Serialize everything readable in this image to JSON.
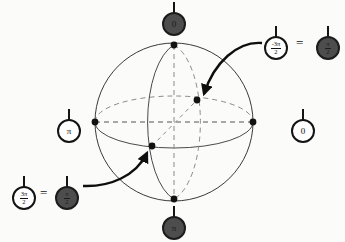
{
  "figure": {
    "type": "diagram",
    "background_color": "#fbfbfa",
    "line_color": "#3a3a3a",
    "dash_color": "#7a7a7a",
    "marker_fill_dark": "#4d4d4d",
    "marker_fill_light": "#ffffff",
    "marker_stroke": "#141414"
  },
  "sphere": {
    "center": {
      "x": 174,
      "y": 122
    },
    "radius": 79,
    "equator_ry": 26,
    "meridian_rx": 34,
    "points": [
      {
        "name": "north-pole",
        "x": 174,
        "y": 45
      },
      {
        "name": "south-pole",
        "x": 174,
        "y": 199
      },
      {
        "name": "equator-left",
        "x": 95,
        "y": 122
      },
      {
        "name": "equator-right",
        "x": 253,
        "y": 122
      },
      {
        "name": "equator-back",
        "x": 197,
        "y": 100
      },
      {
        "name": "equator-front",
        "x": 152,
        "y": 146
      }
    ]
  },
  "markers": {
    "top": {
      "label": "0",
      "kind": "plain",
      "filled": true,
      "x": 162,
      "y": 2
    },
    "bottom": {
      "label": "π",
      "kind": "plain",
      "filled": true,
      "x": 162,
      "y": 206
    },
    "left": {
      "label": "π",
      "kind": "plain",
      "filled": false,
      "x": 57,
      "y": 109
    },
    "right": {
      "label": "0",
      "kind": "plain",
      "filled": false,
      "x": 291,
      "y": 109
    },
    "upper_pair": {
      "left": {
        "numerator": "-3π",
        "denominator": "2",
        "kind": "fraction",
        "filled": false,
        "x": 264,
        "y": 26
      },
      "equals": "=",
      "right": {
        "numerator": "π",
        "denominator": "2",
        "kind": "fraction",
        "filled": true,
        "x": 316,
        "y": 26
      }
    },
    "lower_pair": {
      "left": {
        "numerator": "3π",
        "denominator": "2",
        "kind": "fraction",
        "filled": false,
        "x": 12,
        "y": 176
      },
      "equals": "=",
      "right": {
        "numerator": "π",
        "denominator": "2",
        "kind": "fraction",
        "filled": true,
        "x": 55,
        "y": 176
      }
    }
  },
  "arrows": [
    {
      "name": "arrow-to-back-point",
      "from": {
        "x": 262,
        "y": 43
      },
      "to": {
        "x": 203,
        "y": 95
      }
    },
    {
      "name": "arrow-to-front-point",
      "from": {
        "x": 83,
        "y": 186
      },
      "to": {
        "x": 147,
        "y": 152
      }
    }
  ]
}
